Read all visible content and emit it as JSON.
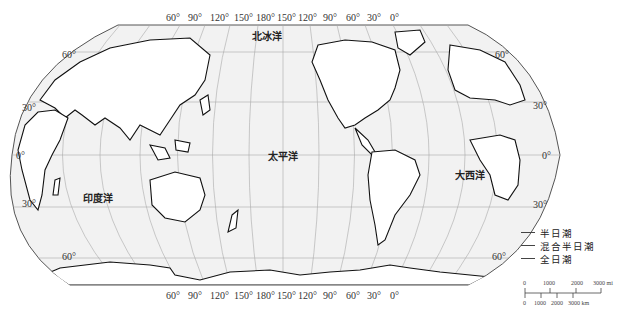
{
  "map": {
    "title": "",
    "projection": "Robinson-like world map, Pacific-centered",
    "background_color": "#f2f2f2",
    "coastline_color": "#111111",
    "graticule_color": "#999999"
  },
  "longitude_labels_top": [
    "60°",
    "90°",
    "120°",
    "150°",
    "180°",
    "150°",
    "120°",
    "90°",
    "60°",
    "30°",
    "0°"
  ],
  "longitude_labels_bottom": [
    "60°",
    "90°",
    "120°",
    "150°",
    "180°",
    "150°",
    "120°",
    "90°",
    "60°",
    "30°",
    "0°"
  ],
  "latitude_labels_left": [
    "60°",
    "30°",
    "0°",
    "30°",
    "60°"
  ],
  "latitude_labels_right": [
    "60°",
    "30°",
    "0°",
    "30°",
    "60°"
  ],
  "oceans": {
    "arctic": "北冰洋",
    "pacific": "太平洋",
    "atlantic": "大西洋",
    "indian": "印度洋"
  },
  "legend": {
    "items": [
      {
        "label": "半日潮",
        "color": "#444444"
      },
      {
        "label": "混合半日潮",
        "color": "#444444"
      },
      {
        "label": "全日潮",
        "color": "#444444"
      }
    ]
  },
  "scale_bar": {
    "top_labels": [
      "0",
      "1000",
      "2000",
      "3000 mi"
    ],
    "bottom_labels": [
      "0",
      "1000",
      "2000",
      "3000 km"
    ]
  }
}
